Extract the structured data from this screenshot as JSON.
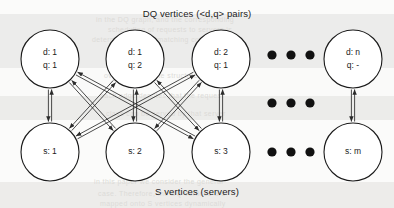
{
  "figure": {
    "title_top": "DQ vertices (<d,q> pairs)",
    "title_bottom": "S vertices (servers)",
    "ink_color": "#1b1b1b",
    "node_fill": "#ffffff",
    "paper_color": "#f2f2f0"
  },
  "dq_vertices": [
    {
      "id": "dq1",
      "line1": "d: 1",
      "line2": "q: 1",
      "cx": 50,
      "cy": 59,
      "r": 29
    },
    {
      "id": "dq2",
      "line1": "d: 1",
      "line2": "q: 2",
      "cx": 135,
      "cy": 59,
      "r": 29
    },
    {
      "id": "dq3",
      "line1": "d: 2",
      "line2": "q: 1",
      "cx": 221,
      "cy": 59,
      "r": 29
    },
    {
      "id": "dqn",
      "line1": "d: n",
      "line2": "q: -",
      "cx": 353,
      "cy": 59,
      "r": 29
    }
  ],
  "s_vertices": [
    {
      "id": "s1",
      "line1": "s: 1",
      "cx": 50,
      "cy": 152,
      "r": 29
    },
    {
      "id": "s2",
      "line1": "s: 2",
      "cx": 135,
      "cy": 152,
      "r": 29
    },
    {
      "id": "s3",
      "line1": "s: 3",
      "cx": 221,
      "cy": 152,
      "r": 29
    },
    {
      "id": "sm",
      "line1": "s: m",
      "cx": 353,
      "cy": 152,
      "r": 29
    }
  ],
  "ellipses": [
    {
      "id": "ellipsis-top",
      "cy": 55,
      "dots": 3,
      "cx_start": 272,
      "gap": 19,
      "r": 4.6
    },
    {
      "id": "ellipsis-middle",
      "cy": 103,
      "dots": 3,
      "cx_start": 272,
      "gap": 19,
      "r": 4.6
    },
    {
      "id": "ellipsis-bottom",
      "cy": 152,
      "dots": 3,
      "cx_start": 272,
      "gap": 19,
      "r": 4.6
    }
  ],
  "edges": [
    {
      "from": "dq1",
      "to": "s1",
      "kind": "bidirectional"
    },
    {
      "from": "dq1",
      "to": "s2",
      "kind": "bidirectional"
    },
    {
      "from": "dq1",
      "to": "s3",
      "kind": "bidirectional"
    },
    {
      "from": "dq2",
      "to": "s1",
      "kind": "bidirectional"
    },
    {
      "from": "dq2",
      "to": "s2",
      "kind": "bidirectional"
    },
    {
      "from": "dq2",
      "to": "s3",
      "kind": "bidirectional"
    },
    {
      "from": "dq3",
      "to": "s1",
      "kind": "bidirectional"
    },
    {
      "from": "dq3",
      "to": "s2",
      "kind": "bidirectional"
    },
    {
      "from": "dq3",
      "to": "s3",
      "kind": "bidirectional"
    },
    {
      "from": "dqn",
      "to": "sm",
      "kind": "bidirectional"
    }
  ],
  "bleed_text": [
    {
      "text": "in the DQ graph, and the corresponding",
      "x": 96,
      "y": 16
    },
    {
      "text": "scheduling of requests to servers is",
      "x": 108,
      "y": 26
    },
    {
      "text": "determined by the matching computed",
      "x": 92,
      "y": 36
    },
    {
      "text": "over this bipartite structure shown",
      "x": 104,
      "y": 72
    },
    {
      "text": "each edge denotes that the request",
      "x": 100,
      "y": 92
    },
    {
      "text": "class can be served by that server",
      "x": 106,
      "y": 110
    },
    {
      "text": "in this paper we consider the general",
      "x": 94,
      "y": 178
    },
    {
      "text": "case. Therefore, the DQ vertices are",
      "x": 98,
      "y": 190
    },
    {
      "text": "mapped onto S vertices dynamically",
      "x": 100,
      "y": 200
    }
  ]
}
